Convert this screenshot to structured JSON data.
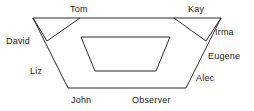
{
  "diagram": {
    "type": "trapezoid-role-diagram",
    "stroke_color": "#2b2b2b",
    "background_color": "#ffffff",
    "text_color": "#1a1a1a",
    "labels": [
      {
        "name": "tom",
        "text": "Tom",
        "x": 70,
        "y": 4
      },
      {
        "name": "kay",
        "text": "Kay",
        "x": 188,
        "y": 4
      },
      {
        "name": "irma",
        "text": "Irma",
        "x": 215,
        "y": 27
      },
      {
        "name": "david",
        "text": "David",
        "x": 6,
        "y": 36
      },
      {
        "name": "eugene",
        "text": "Eugene",
        "x": 208,
        "y": 51
      },
      {
        "name": "liz",
        "text": "Liz",
        "x": 30,
        "y": 66
      },
      {
        "name": "alec",
        "text": "Alec",
        "x": 196,
        "y": 73
      },
      {
        "name": "john",
        "text": "John",
        "x": 71,
        "y": 95
      },
      {
        "name": "observer",
        "text": "Observer",
        "x": 132,
        "y": 95
      }
    ],
    "shapes": {
      "outer_top_edge": "M33,18 L221,18",
      "outer_left_edge": "M33,18 L68,88",
      "outer_right_edge": "M221,18 L186,88",
      "outer_bottom_edge": "M68,88 L186,88",
      "left_notch": "M47,41 L80,18",
      "left_notch_down": "M33,18 L47,41",
      "right_notch": "M206,41 L174,18",
      "right_notch_down": "M221,18 L206,41",
      "inner_top_edge": "M81,37 L170,37",
      "inner_left_edge": "M81,37 L95,71",
      "inner_right_edge": "M170,37 L156,71",
      "inner_bottom_edge": "M95,71 L156,71"
    }
  }
}
